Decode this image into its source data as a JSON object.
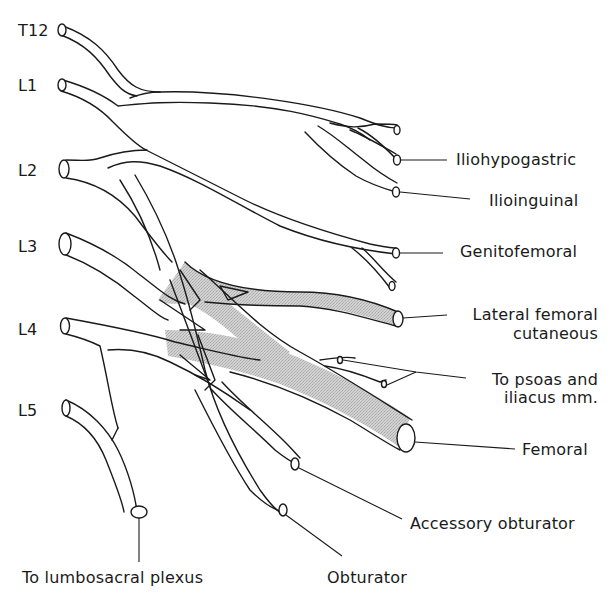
{
  "diagram": {
    "kind": "anatomical line drawing",
    "colors": {
      "line": "#1a1a1a",
      "shading": "#c8c8c8",
      "background": "#ffffff"
    },
    "roots": [
      {
        "id": "t12",
        "label": "T12"
      },
      {
        "id": "l1",
        "label": "L1"
      },
      {
        "id": "l2",
        "label": "L2"
      },
      {
        "id": "l3",
        "label": "L3"
      },
      {
        "id": "l4",
        "label": "L4"
      },
      {
        "id": "l5",
        "label": "L5"
      }
    ],
    "branches": [
      {
        "id": "iliohypogastric",
        "label": "Iliohypogastric"
      },
      {
        "id": "ilioinguinal",
        "label": "Ilioinguinal"
      },
      {
        "id": "genitofemoral",
        "label": "Genitofemoral"
      },
      {
        "id": "lateral_femoral_cutaneous",
        "label_line1": "Lateral femoral",
        "label_line2": "cutaneous"
      },
      {
        "id": "psoas_iliacus",
        "label_line1": "To psoas and",
        "label_line2": "iliacus mm."
      },
      {
        "id": "femoral",
        "label": "Femoral"
      },
      {
        "id": "accessory_obturator",
        "label": "Accessory obturator"
      },
      {
        "id": "obturator",
        "label": "Obturator"
      },
      {
        "id": "lumbosacral",
        "label": "To lumbosacral plexus"
      }
    ],
    "shaded_region_meaning": "posterior divisions (stippled)"
  }
}
